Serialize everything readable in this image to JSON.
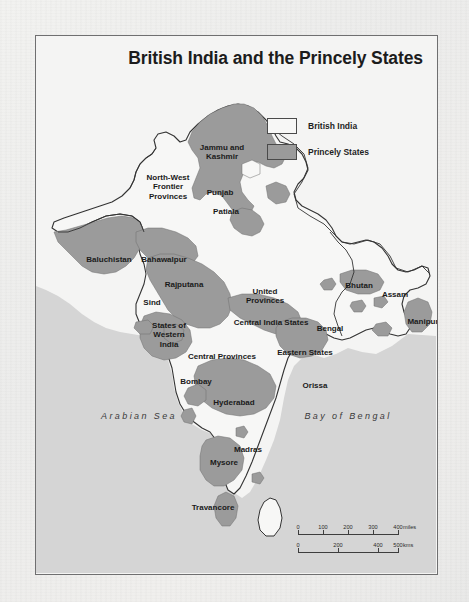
{
  "figure": {
    "title": "British India and the Princely States"
  },
  "legend": {
    "items": [
      {
        "label": "British India",
        "swatch": "white-box",
        "color": "#f7f7f6"
      },
      {
        "label": "Princely States",
        "swatch": "gray-filled-box",
        "color": "#9b9b9b"
      }
    ]
  },
  "colors": {
    "ocean": "#d5d5d5",
    "british_india": "#f7f7f6",
    "princely_states": "#9b9b9b",
    "border_line": "#333333",
    "frame": "#6f6f70",
    "page": "#efefef"
  },
  "places": [
    {
      "name": "Jammu and Kashmir",
      "text": "Jammu and\nKashmir",
      "x": 186,
      "y": 107,
      "type": "princely-state"
    },
    {
      "name": "North-West Frontier Provinces",
      "text": "North-West\nFrontier\nProvinces",
      "x": 132,
      "y": 137,
      "type": "british-province"
    },
    {
      "name": "Punjab",
      "text": "Punjab",
      "x": 184,
      "y": 152,
      "type": "british-province"
    },
    {
      "name": "Patiala",
      "text": "Patiala",
      "x": 190,
      "y": 171,
      "type": "princely-state"
    },
    {
      "name": "Baluchistan",
      "text": "Baluchistan",
      "x": 73,
      "y": 219,
      "type": "british-province"
    },
    {
      "name": "Bahawalpur",
      "text": "Bahawalpur",
      "x": 128,
      "y": 219,
      "type": "princely-state"
    },
    {
      "name": "Rajputana",
      "text": "Rajputana",
      "x": 148,
      "y": 244,
      "type": "princely-state"
    },
    {
      "name": "Sind",
      "text": "Sind",
      "x": 116,
      "y": 262,
      "type": "british-province"
    },
    {
      "name": "United Provinces",
      "text": "United\nProvinces",
      "x": 229,
      "y": 251,
      "type": "british-province"
    },
    {
      "name": "States of Western India",
      "text": "States of\nWestern\nIndia",
      "x": 133,
      "y": 285,
      "type": "princely-state"
    },
    {
      "name": "Central India States",
      "text": "Central India States",
      "x": 235,
      "y": 282,
      "type": "princely-state"
    },
    {
      "name": "Central Provinces",
      "text": "Central Provinces",
      "x": 186,
      "y": 316,
      "type": "british-province"
    },
    {
      "name": "Eastern States",
      "text": "Eastern States",
      "x": 269,
      "y": 312,
      "type": "princely-state"
    },
    {
      "name": "Bhutan",
      "text": "Bhutan",
      "x": 323,
      "y": 245,
      "type": "princely-state"
    },
    {
      "name": "Assam",
      "text": "Assam",
      "x": 359,
      "y": 254,
      "type": "british-province"
    },
    {
      "name": "Manipur",
      "text": "Manipur",
      "x": 387,
      "y": 281,
      "type": "princely-state"
    },
    {
      "name": "Bengal",
      "text": "Bengal",
      "x": 294,
      "y": 288,
      "type": "british-province"
    },
    {
      "name": "Bombay",
      "text": "Bombay",
      "x": 160,
      "y": 341,
      "type": "british-province"
    },
    {
      "name": "Orissa",
      "text": "Orissa",
      "x": 279,
      "y": 345,
      "type": "british-province"
    },
    {
      "name": "Hyderabad",
      "text": "Hyderabad",
      "x": 198,
      "y": 362,
      "type": "princely-state"
    },
    {
      "name": "Madras",
      "text": "Madras",
      "x": 212,
      "y": 409,
      "type": "british-province"
    },
    {
      "name": "Mysore",
      "text": "Mysore",
      "x": 188,
      "y": 422,
      "type": "princely-state"
    },
    {
      "name": "Travancore",
      "text": "Travancore",
      "x": 177,
      "y": 467,
      "type": "princely-state"
    }
  ],
  "seas": [
    {
      "name": "Arabian Sea",
      "text": "Arabian Sea",
      "x": 103,
      "y": 375
    },
    {
      "name": "Bay of Bengal",
      "text": "Bay of Bengal",
      "x": 312,
      "y": 375
    },
    {
      "name": "Indian Ocean",
      "text": "Indian Ocean",
      "x": 170,
      "y": 544
    }
  ],
  "scalebar": {
    "miles": {
      "unit": "miles",
      "ticks": [
        "0",
        "100",
        "200",
        "300",
        "400"
      ],
      "positions": [
        0,
        25,
        50,
        75,
        100
      ]
    },
    "kms": {
      "unit": "kms",
      "ticks": [
        "0",
        "200",
        "400",
        "500"
      ],
      "positions": [
        0,
        40,
        80,
        100
      ]
    }
  }
}
